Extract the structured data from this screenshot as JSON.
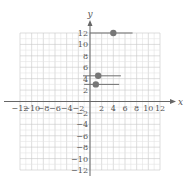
{
  "chart_data": {
    "type": "scatter",
    "title": "",
    "xlabel": "x",
    "ylabel": "y",
    "xlim": [
      -12,
      12
    ],
    "ylim": [
      -12,
      12
    ],
    "grid": true,
    "x_ticks": [
      -12,
      -10,
      -8,
      -6,
      -4,
      -2,
      2,
      4,
      6,
      8,
      10,
      12
    ],
    "y_ticks": [
      -12,
      -10,
      -8,
      -6,
      -4,
      -2,
      2,
      4,
      6,
      8,
      10,
      12
    ],
    "x_tick_labels": [
      "−12",
      "−10",
      "−8",
      "−6",
      "−4",
      "−2",
      "2",
      "4",
      "6",
      "8",
      "10",
      "12"
    ],
    "y_tick_labels": [
      "−12",
      "−10",
      "−8",
      "−6",
      "−4",
      "−2",
      "2",
      "4",
      "6",
      "8",
      "10",
      "12"
    ],
    "series": [
      {
        "name": "points with horizontal segments",
        "points": [
          {
            "x": 4,
            "y": 12,
            "segment_x": [
              0,
              7.3
            ]
          },
          {
            "x": 1.4,
            "y": 4.5,
            "segment_x": [
              -1.2,
              5.3
            ]
          },
          {
            "x": 1,
            "y": 3,
            "segment_x": [
              -1,
              5
            ]
          }
        ]
      }
    ],
    "colors": {
      "point": "#777777",
      "segment": "#6e6e6e",
      "axis": "#666666",
      "grid_major": "#c8c8c8",
      "grid_minor": "#e4e4e4"
    }
  },
  "labels": {
    "x_axis": "x",
    "y_axis": "y"
  }
}
